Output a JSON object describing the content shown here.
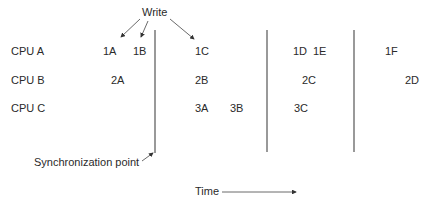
{
  "diagram": {
    "write_label": "Write",
    "sync_label": "Synchronization point",
    "time_label": "Time",
    "rows": [
      {
        "label": "CPU A"
      },
      {
        "label": "CPU B"
      },
      {
        "label": "CPU C"
      }
    ],
    "events": {
      "a1": "1A",
      "a2": "1B",
      "a3": "1C",
      "a4": "1D",
      "a5": "1E",
      "a6": "1F",
      "b1": "2A",
      "b2": "2B",
      "b3": "2C",
      "b4": "2D",
      "c1": "3A",
      "c2": "3B",
      "c3": "3C"
    },
    "colors": {
      "ink": "#2a2a2a",
      "line": "#555555"
    }
  }
}
